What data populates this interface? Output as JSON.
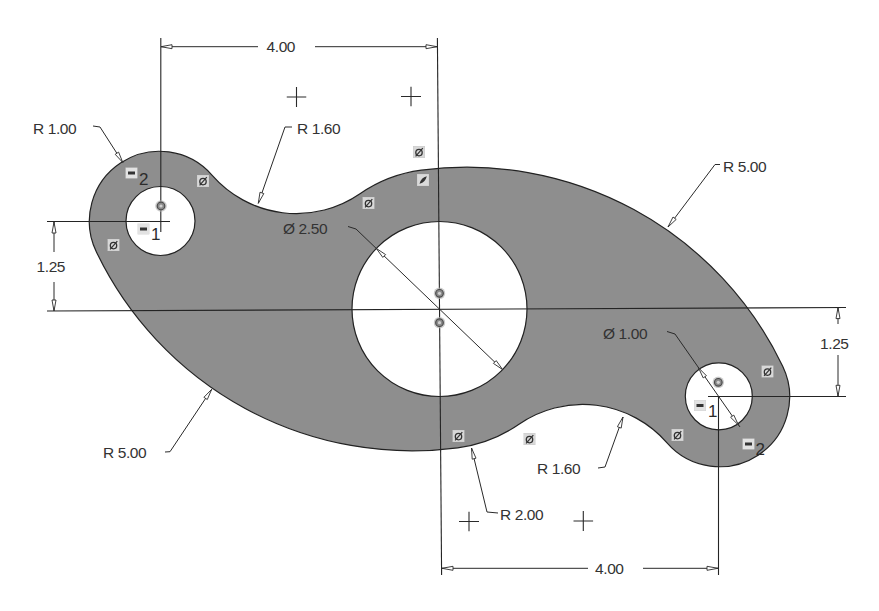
{
  "sketch": {
    "dimensions": {
      "horizontal_top": {
        "label": "4.00",
        "value": 4.0
      },
      "horizontal_bottom": {
        "label": "4.00",
        "value": 4.0
      },
      "vertical_left": {
        "label": "1.25",
        "value": 1.25
      },
      "vertical_right": {
        "label": "1.25",
        "value": 1.25
      },
      "large_hole_diameter": {
        "label": "Ø 2.50",
        "value": 2.5
      },
      "small_hole_diameter": {
        "label": "Ø 1.00",
        "value": 1.0
      },
      "left_boss_radius": {
        "label": "R 1.00",
        "value": 1.0
      },
      "upper_fillet_radius": {
        "label": "R 1.60",
        "value": 1.6
      },
      "lower_fillet_radius": {
        "label": "R 1.60",
        "value": 1.6
      },
      "upper_right_arc_radius": {
        "label": "R 5.00",
        "value": 5.0
      },
      "lower_left_arc_radius": {
        "label": "R 5.00",
        "value": 5.0
      },
      "center_boss_radius": {
        "label": "R 2.00",
        "value": 2.0
      }
    },
    "constraints": {
      "equal_left_boss": {
        "icon": "equal-constraint-icon",
        "index": "2"
      },
      "equal_left_hole": {
        "icon": "equal-constraint-icon",
        "index": "1"
      },
      "equal_right_hole": {
        "icon": "equal-constraint-icon",
        "index": "1"
      },
      "equal_right_boss": {
        "icon": "equal-constraint-icon",
        "index": "2"
      },
      "tangent": {
        "icon": "tangent-constraint-icon",
        "count": 8
      },
      "coincident": {
        "icon": "coincident-constraint-icon",
        "count": 4
      },
      "smooth": {
        "icon": "smooth-constraint-icon",
        "count": 1
      },
      "sketch_points": {
        "icon": "sketch-point-icon",
        "count": 4
      }
    },
    "colors": {
      "background": "#ffffff",
      "profile_fill": "#8e8e8e",
      "geometry_line": "#242424",
      "dimension_text": "#333333",
      "constraint_icon_bg": "#d6d6d6"
    }
  }
}
